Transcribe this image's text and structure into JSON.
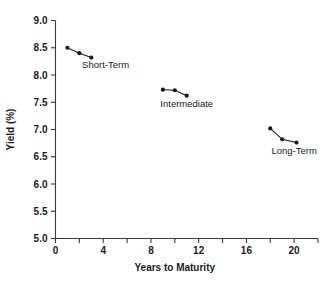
{
  "chart_data": {
    "type": "line",
    "title": "",
    "xlabel": "Years to Maturity",
    "ylabel": "Yield (%)",
    "xlim": [
      0,
      22
    ],
    "ylim": [
      5.0,
      9.0
    ],
    "grid": false,
    "legend_position": "inline-annotations",
    "x_ticks_major": [
      0,
      4,
      8,
      12,
      16,
      20
    ],
    "x_tick_labels": [
      "0",
      "4",
      "8",
      "12",
      "16",
      "20"
    ],
    "x_ticks_minor": [
      2,
      6,
      10,
      14,
      18,
      22
    ],
    "y_ticks": [
      5.0,
      5.5,
      6.0,
      6.5,
      7.0,
      7.5,
      8.0,
      8.5,
      9.0
    ],
    "y_tick_labels": [
      "5.0",
      "5.5",
      "6.0",
      "6.5",
      "7.0",
      "7.5",
      "8.0",
      "8.5",
      "9.0"
    ],
    "series": [
      {
        "name": "Short-Term",
        "x": [
          1,
          2,
          3
        ],
        "values": [
          8.5,
          8.4,
          8.32
        ],
        "label_x": 4.2,
        "label_y": 8.13,
        "color": "#1a1a1a"
      },
      {
        "name": "Intermediate",
        "x": [
          9,
          10,
          11
        ],
        "values": [
          7.73,
          7.72,
          7.62
        ],
        "label_x": 11.0,
        "label_y": 7.41,
        "color": "#1a1a1a"
      },
      {
        "name": "Long-Term",
        "x": [
          18,
          19,
          20.2
        ],
        "values": [
          7.02,
          6.82,
          6.76
        ],
        "label_x": 20.0,
        "label_y": 6.55,
        "color": "#1a1a1a"
      }
    ]
  },
  "axes": {
    "x_axis_title": "Years to Maturity",
    "y_axis_title": "Yield (%)"
  },
  "annotations": {
    "short_term": "Short-Term",
    "intermediate": "Intermediate",
    "long_term": "Long-Term"
  }
}
